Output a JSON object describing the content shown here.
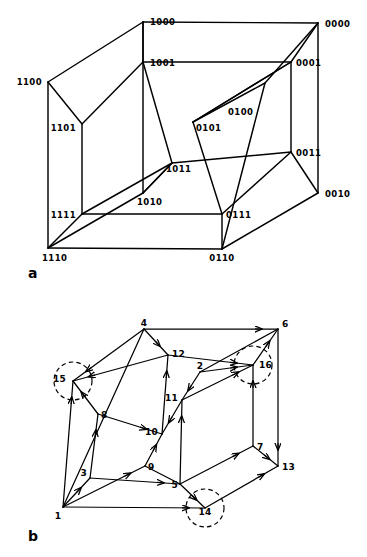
{
  "figure": {
    "panel_a_letter": "a",
    "panel_b_letter": "b",
    "caption_partial": ""
  },
  "panel_a": {
    "type": "tesseract-graph",
    "description": "4-dimensional hypercube (tesseract) drawn as an outer cube containing an inner cube, vertices labelled with 4-bit binary codes",
    "vertices": [
      {
        "id": "1000",
        "label": "1000",
        "x": 143,
        "y": 22,
        "lx": 150,
        "ly": 25,
        "anchor": "start",
        "cube": "outer"
      },
      {
        "id": "0000",
        "label": "0000",
        "x": 318,
        "y": 23,
        "lx": 325,
        "ly": 27,
        "anchor": "start",
        "cube": "outer"
      },
      {
        "id": "1100",
        "label": "1100",
        "x": 48,
        "y": 82,
        "lx": 42,
        "ly": 85,
        "anchor": "end",
        "cube": "outer"
      },
      {
        "id": "0100",
        "label": "0100",
        "x": 265,
        "y": 83,
        "lx": 228,
        "ly": 115,
        "anchor": "start",
        "cube": "outer"
      },
      {
        "id": "1110",
        "label": "1110",
        "x": 48,
        "y": 248,
        "lx": 42,
        "ly": 261,
        "anchor": "start",
        "cube": "outer"
      },
      {
        "id": "0110",
        "label": "0110",
        "x": 222,
        "y": 249,
        "lx": 222,
        "ly": 261,
        "anchor": "middle",
        "cube": "outer"
      },
      {
        "id": "0010",
        "label": "0010",
        "x": 318,
        "y": 193,
        "lx": 325,
        "ly": 197,
        "anchor": "start",
        "cube": "outer"
      },
      {
        "id": "1010",
        "label": "1010",
        "x": 143,
        "y": 193,
        "lx": 137,
        "ly": 205,
        "anchor": "start",
        "cube": "outer"
      },
      {
        "id": "1001",
        "label": "1001",
        "x": 143,
        "y": 62,
        "lx": 150,
        "ly": 66,
        "anchor": "start",
        "cube": "inner"
      },
      {
        "id": "0001",
        "label": "0001",
        "x": 291,
        "y": 62,
        "lx": 296,
        "ly": 66,
        "anchor": "start",
        "cube": "inner"
      },
      {
        "id": "1101",
        "label": "1101",
        "x": 82,
        "y": 124,
        "lx": 76,
        "ly": 131,
        "anchor": "end",
        "cube": "inner"
      },
      {
        "id": "0101",
        "label": "0101",
        "x": 193,
        "y": 122,
        "lx": 196,
        "ly": 131,
        "anchor": "start",
        "cube": "inner"
      },
      {
        "id": "1111",
        "label": "1111",
        "x": 82,
        "y": 214,
        "lx": 76,
        "ly": 218,
        "anchor": "end",
        "cube": "inner"
      },
      {
        "id": "0111",
        "label": "0111",
        "x": 222,
        "y": 214,
        "lx": 226,
        "ly": 218,
        "anchor": "start",
        "cube": "inner"
      },
      {
        "id": "1011",
        "label": "1011",
        "x": 172,
        "y": 163,
        "lx": 166,
        "ly": 172,
        "anchor": "start",
        "cube": "inner"
      },
      {
        "id": "0011",
        "label": "0011",
        "x": 291,
        "y": 152,
        "lx": 296,
        "ly": 156,
        "anchor": "start",
        "cube": "inner"
      }
    ],
    "edges": [
      [
        "1000",
        "0000"
      ],
      [
        "1000",
        "1100"
      ],
      [
        "1000",
        "1001"
      ],
      [
        "0000",
        "0100"
      ],
      [
        "0000",
        "0001"
      ],
      [
        "1100",
        "1110"
      ],
      [
        "1100",
        "1101"
      ],
      [
        "0100",
        "0110"
      ],
      [
        "0100",
        "0101"
      ],
      [
        "1110",
        "0110"
      ],
      [
        "1110",
        "1111"
      ],
      [
        "1110",
        "1010"
      ],
      [
        "0110",
        "0111"
      ],
      [
        "0010",
        "0000"
      ],
      [
        "0010",
        "0110"
      ],
      [
        "0010",
        "0011"
      ],
      [
        "1010",
        "1000"
      ],
      [
        "1010",
        "1011"
      ],
      [
        "1001",
        "0001"
      ],
      [
        "1001",
        "1101"
      ],
      [
        "0001",
        "0101"
      ],
      [
        "1101",
        "1111"
      ],
      [
        "0101",
        "0111"
      ],
      [
        "0101",
        "0001"
      ],
      [
        "1111",
        "0111"
      ],
      [
        "1111",
        "1011"
      ],
      [
        "0111",
        "0011"
      ],
      [
        "1011",
        "1001"
      ],
      [
        "1011",
        "0011"
      ],
      [
        "1011",
        "1010"
      ],
      [
        "0011",
        "0001"
      ]
    ]
  },
  "panel_b": {
    "type": "labelled-cube-graph",
    "description": "Cube graph with directed arrows along edges and diagonals, nodes labelled 1-16; nodes 14, 15 and 16 are circled with dashed circles",
    "nodes": [
      {
        "id": "1",
        "label": "1",
        "x": 63,
        "y": 507,
        "lx": 58,
        "ly": 519,
        "anchor": "middle",
        "circled": false
      },
      {
        "id": "2",
        "label": "2",
        "x": 200,
        "y": 372,
        "lx": 200,
        "ly": 369,
        "anchor": "middle",
        "circled": false
      },
      {
        "id": "3",
        "label": "3",
        "x": 90,
        "y": 478,
        "lx": 87,
        "ly": 476,
        "anchor": "end",
        "circled": false
      },
      {
        "id": "4",
        "label": "4",
        "x": 144,
        "y": 329,
        "lx": 144,
        "ly": 326,
        "anchor": "middle",
        "circled": false
      },
      {
        "id": "5",
        "label": "5",
        "x": 180,
        "y": 484,
        "lx": 178,
        "ly": 488,
        "anchor": "end",
        "circled": false
      },
      {
        "id": "6",
        "label": "6",
        "x": 278,
        "y": 329,
        "lx": 282,
        "ly": 327,
        "anchor": "start",
        "circled": false
      },
      {
        "id": "7",
        "label": "7",
        "x": 253,
        "y": 446,
        "lx": 257,
        "ly": 450,
        "anchor": "start",
        "circled": false
      },
      {
        "id": "8",
        "label": "8",
        "x": 98,
        "y": 414,
        "lx": 101,
        "ly": 418,
        "anchor": "start",
        "circled": false
      },
      {
        "id": "9",
        "label": "9",
        "x": 145,
        "y": 466,
        "lx": 148,
        "ly": 470,
        "anchor": "start",
        "circled": false
      },
      {
        "id": "10",
        "label": "10",
        "x": 162,
        "y": 434,
        "lx": 158,
        "ly": 435,
        "anchor": "end",
        "circled": false
      },
      {
        "id": "11",
        "label": "11",
        "x": 182,
        "y": 400,
        "lx": 178,
        "ly": 401,
        "anchor": "end",
        "circled": false
      },
      {
        "id": "12",
        "label": "12",
        "x": 168,
        "y": 355,
        "lx": 172,
        "ly": 357,
        "anchor": "start",
        "circled": false
      },
      {
        "id": "13",
        "label": "13",
        "x": 278,
        "y": 466,
        "lx": 282,
        "ly": 470,
        "anchor": "start",
        "circled": false
      },
      {
        "id": "14",
        "label": "14",
        "x": 205,
        "y": 508,
        "lx": 205,
        "ly": 515,
        "anchor": "middle",
        "circled": true
      },
      {
        "id": "15",
        "label": "15",
        "x": 73,
        "y": 381,
        "lx": 66,
        "ly": 382,
        "anchor": "end",
        "circled": true
      },
      {
        "id": "16",
        "label": "16",
        "x": 253,
        "y": 365,
        "lx": 259,
        "ly": 368,
        "anchor": "start",
        "circled": true
      }
    ],
    "circled_nodes": [
      "14",
      "15",
      "16"
    ],
    "circle_radius": 19,
    "edges": [
      {
        "from": "4",
        "to": "6",
        "arrow": "mid"
      },
      {
        "from": "4",
        "to": "15",
        "arrow": "mid"
      },
      {
        "from": "4",
        "to": "12",
        "arrow": "mid"
      },
      {
        "from": "4",
        "to": "1",
        "arrow": "none"
      },
      {
        "from": "6",
        "to": "13",
        "arrow": "mid"
      },
      {
        "from": "6",
        "to": "16",
        "arrow": "rev"
      },
      {
        "from": "6",
        "to": "2",
        "arrow": "none"
      },
      {
        "from": "15",
        "to": "8",
        "arrow": "rev"
      },
      {
        "from": "15",
        "to": "12",
        "arrow": "rev"
      },
      {
        "from": "15",
        "to": "1",
        "arrow": "rev"
      },
      {
        "from": "1",
        "to": "3",
        "arrow": "mid"
      },
      {
        "from": "1",
        "to": "9",
        "arrow": "mid"
      },
      {
        "from": "1",
        "to": "14",
        "arrow": "mid"
      },
      {
        "from": "3",
        "to": "5",
        "arrow": "mid"
      },
      {
        "from": "3",
        "to": "8",
        "arrow": "mid"
      },
      {
        "from": "5",
        "to": "14",
        "arrow": "mid"
      },
      {
        "from": "5",
        "to": "11",
        "arrow": "mid"
      },
      {
        "from": "5",
        "to": "7",
        "arrow": "mid"
      },
      {
        "from": "7",
        "to": "13",
        "arrow": "mid"
      },
      {
        "from": "7",
        "to": "16",
        "arrow": "mid"
      },
      {
        "from": "13",
        "to": "14",
        "arrow": "rev"
      },
      {
        "from": "9",
        "to": "10",
        "arrow": "mid"
      },
      {
        "from": "10",
        "to": "12",
        "arrow": "mid"
      },
      {
        "from": "10",
        "to": "11",
        "arrow": "rev"
      },
      {
        "from": "11",
        "to": "16",
        "arrow": "mid"
      },
      {
        "from": "2",
        "to": "11",
        "arrow": "mid"
      },
      {
        "from": "2",
        "to": "16",
        "arrow": "mid"
      },
      {
        "from": "12",
        "to": "16",
        "arrow": "mid"
      },
      {
        "from": "8",
        "to": "10",
        "arrow": "mid"
      },
      {
        "from": "9",
        "to": "5",
        "arrow": "none"
      }
    ]
  },
  "colors": {
    "ink": "#000000",
    "paper": "#ffffff",
    "caption_gray": "#9a9a9a"
  }
}
